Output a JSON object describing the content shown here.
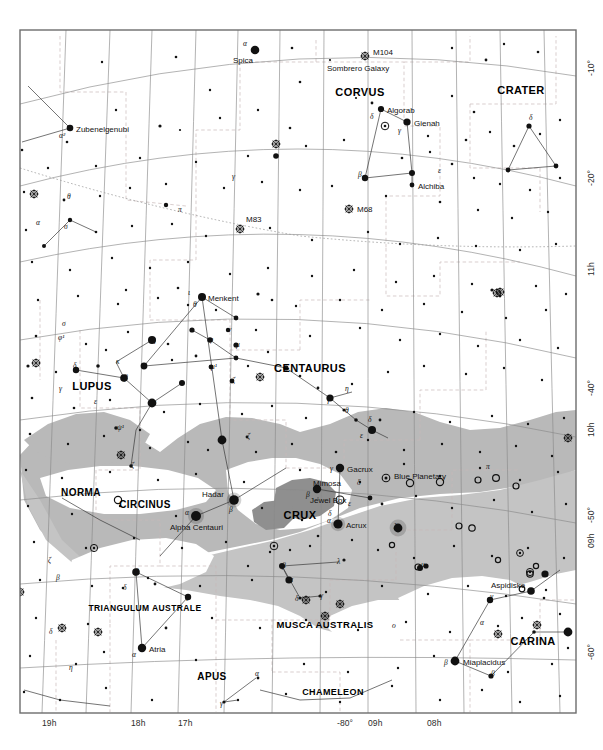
{
  "chart_data": {
    "type": "scatter",
    "projection": "conic equidistant",
    "grid": true,
    "legend_position": "none",
    "xlabel": "Right Ascension (hours)",
    "ylabel": "Declination (degrees)",
    "xlim": [
      19,
      7.5
    ],
    "ylim": [
      -65,
      -5
    ],
    "background_color": "#ffffff",
    "milky_way_color": "#b8b8b8",
    "milky_way_dark_color": "#9a9a9a",
    "grid_color": "#7c7c7c",
    "boundary_color": "#b0a9a9",
    "frame_color": "#6d6d6d",
    "star_color": "#111111",
    "axis_ticks_ra_bottom": [
      {
        "label": "19h",
        "x": 42
      },
      {
        "label": "18h",
        "x": 131
      },
      {
        "label": "17h",
        "x": 178
      },
      {
        "label": "-80°",
        "x": 337
      },
      {
        "label": "09h",
        "x": 368
      },
      {
        "label": "08h",
        "x": 427
      }
    ],
    "axis_ticks_right": [
      {
        "label": "-10°",
        "y": 76
      },
      {
        "label": "-20°",
        "y": 186
      },
      {
        "label": "11h",
        "y": 276
      },
      {
        "label": "-40°",
        "y": 396
      },
      {
        "label": "10h",
        "y": 437
      },
      {
        "label": "-50°",
        "y": 523
      },
      {
        "label": "09h",
        "y": 548
      },
      {
        "label": "-60°",
        "y": 660
      }
    ],
    "constellations": [
      {
        "name": "CORVUS",
        "x": 360,
        "y": 92,
        "size": 11
      },
      {
        "name": "CRATER",
        "x": 521,
        "y": 90,
        "size": 11
      },
      {
        "name": "CENTAURUS",
        "x": 310,
        "y": 368,
        "size": 11
      },
      {
        "name": "LUPUS",
        "x": 92,
        "y": 386,
        "size": 11
      },
      {
        "name": "NORMA",
        "x": 81,
        "y": 492,
        "size": 10
      },
      {
        "name": "CIRCINUS",
        "x": 145,
        "y": 504,
        "size": 10
      },
      {
        "name": "CRUX",
        "x": 300,
        "y": 515,
        "size": 11
      },
      {
        "name": "MUSCA AUSTRALIS",
        "x": 325,
        "y": 624,
        "size": 9.5
      },
      {
        "name": "TRIANGULUM AUSTRALE",
        "x": 145,
        "y": 608,
        "size": 8.5
      },
      {
        "name": "APUS",
        "x": 212,
        "y": 676,
        "size": 10
      },
      {
        "name": "CHAMELEON",
        "x": 333,
        "y": 692,
        "size": 9
      },
      {
        "name": "CARINA",
        "x": 533,
        "y": 641,
        "size": 11
      }
    ],
    "named_stars": [
      {
        "name": "Spica",
        "x": 255,
        "y": 50,
        "mag": 1.0,
        "label_dx": -22,
        "label_dy": 12,
        "greek": "α",
        "gdx": -12,
        "gdy": -5
      },
      {
        "name": "Zubenelgenubi",
        "x": 70,
        "y": 128,
        "mag": 2.7,
        "label_dx": 6,
        "label_dy": 3,
        "greek": "α²",
        "gdx": -11,
        "gdy": 9
      },
      {
        "name": "Algorab",
        "x": 381,
        "y": 109,
        "mag": 2.9,
        "label_dx": 6,
        "label_dy": 3,
        "greek": "δ",
        "gdx": -11,
        "gdy": 9
      },
      {
        "name": "Gienah",
        "x": 407,
        "y": 122,
        "mag": 2.6,
        "label_dx": 7,
        "label_dy": 3,
        "greek": "γ",
        "gdx": -9,
        "gdy": 10
      },
      {
        "name": "Alchiba",
        "x": 412,
        "y": 185,
        "mag": 4.0,
        "label_dx": 6,
        "label_dy": 3,
        "greek": "",
        "gdx": 0,
        "gdy": 0
      },
      {
        "name": "Menkent",
        "x": 202,
        "y": 297,
        "mag": 2.1,
        "label_dx": 6,
        "label_dy": 3,
        "greek": "θ",
        "gdx": -9,
        "gdy": 9
      },
      {
        "name": "Gacrux",
        "x": 340,
        "y": 468,
        "mag": 1.6,
        "label_dx": 7,
        "label_dy": 3,
        "greek": "γ",
        "gdx": -10,
        "gdy": 2
      },
      {
        "name": "Mimosa",
        "x": 317,
        "y": 489,
        "mag": 1.3,
        "label_dx": -4,
        "label_dy": -4,
        "greek": "β",
        "gdx": -11,
        "gdy": 7
      },
      {
        "name": "Acrux",
        "x": 338,
        "y": 524,
        "mag": 0.8,
        "label_dx": 8,
        "label_dy": 3,
        "greek": "α",
        "gdx": -11,
        "gdy": -2
      },
      {
        "name": "Hadar",
        "x": 234,
        "y": 500,
        "mag": 0.6,
        "label_dx": -32,
        "label_dy": -4,
        "greek": "β",
        "gdx": -5,
        "gdy": 11
      },
      {
        "name": "Alpha Centauri",
        "x": 196,
        "y": 516,
        "mag": 0.0,
        "label_dx": -26,
        "label_dy": 13,
        "greek": "α",
        "gdx": -11,
        "gdy": -2
      },
      {
        "name": "Atria",
        "x": 142,
        "y": 648,
        "mag": 1.9,
        "label_dx": 7,
        "label_dy": 3,
        "greek": "α",
        "gdx": -10,
        "gdy": 8
      },
      {
        "name": "Miaplacidus",
        "x": 455,
        "y": 661,
        "mag": 1.7,
        "label_dx": 8,
        "label_dy": 3,
        "greek": "β",
        "gdx": -11,
        "gdy": 3
      },
      {
        "name": "Aspidiske",
        "x": 531,
        "y": 591,
        "mag": 2.2,
        "label_dx": -40,
        "label_dy": -4,
        "greek": "",
        "gdx": 0,
        "gdy": 0
      }
    ],
    "deep_sky_objects": [
      {
        "name": "M104",
        "x": 365,
        "y": 56,
        "kind": "galaxy",
        "label_dx": 8,
        "label_dy": -2
      },
      {
        "name": "Sombrero Galaxy",
        "x": 365,
        "y": 56,
        "kind": "caption",
        "label_dx": -38,
        "label_dy": 14
      },
      {
        "name": "M68",
        "x": 349,
        "y": 209,
        "kind": "globular",
        "label_dx": 8,
        "label_dy": 2
      },
      {
        "name": "M83",
        "x": 240,
        "y": 229,
        "kind": "galaxy",
        "label_dx": 6,
        "label_dy": -8
      },
      {
        "name": "Blue Planetary",
        "x": 386,
        "y": 478,
        "kind": "planetary",
        "label_dx": 8,
        "label_dy": 0
      },
      {
        "name": "Jewel Box",
        "x": 340,
        "y": 500,
        "kind": "open",
        "label_dx": -30,
        "label_dy": 2
      }
    ],
    "greek_labels": [
      {
        "g": "δ",
        "x": 529,
        "y": 118
      },
      {
        "g": "γ",
        "x": 232,
        "y": 177
      },
      {
        "g": "π",
        "x": 178,
        "y": 210
      },
      {
        "g": "σ",
        "x": 64,
        "y": 227
      },
      {
        "g": "θ",
        "x": 67,
        "y": 197
      },
      {
        "g": "ε",
        "x": 438,
        "y": 171
      },
      {
        "g": "β",
        "x": 358,
        "y": 175
      },
      {
        "g": "σ",
        "x": 62,
        "y": 324
      },
      {
        "g": "φ¹",
        "x": 58,
        "y": 338
      },
      {
        "g": "δ",
        "x": 73,
        "y": 366
      },
      {
        "g": "γ",
        "x": 59,
        "y": 389
      },
      {
        "g": "κ",
        "x": 116,
        "y": 362
      },
      {
        "g": "β",
        "x": 124,
        "y": 378
      },
      {
        "g": "ε",
        "x": 94,
        "y": 402
      },
      {
        "g": "α",
        "x": 152,
        "y": 403
      },
      {
        "g": "ψ¹",
        "x": 117,
        "y": 428
      },
      {
        "g": "ζ",
        "x": 131,
        "y": 466
      },
      {
        "g": "η",
        "x": 152,
        "y": 340
      },
      {
        "g": "ι",
        "x": 182,
        "y": 383
      },
      {
        "g": "φ",
        "x": 209,
        "y": 340
      },
      {
        "g": "μ",
        "x": 236,
        "y": 345
      },
      {
        "g": "ν",
        "x": 228,
        "y": 330
      },
      {
        "g": "μ¹",
        "x": 211,
        "y": 367
      },
      {
        "g": "ζ",
        "x": 232,
        "y": 381
      },
      {
        "g": "γ",
        "x": 327,
        "y": 400
      },
      {
        "g": "η",
        "x": 345,
        "y": 389
      },
      {
        "g": "θ",
        "x": 345,
        "y": 411
      },
      {
        "g": "δ",
        "x": 368,
        "y": 420
      },
      {
        "g": "ε",
        "x": 360,
        "y": 436
      },
      {
        "g": "ζ",
        "x": 247,
        "y": 437
      },
      {
        "g": "π",
        "x": 486,
        "y": 467
      },
      {
        "g": "δ",
        "x": 357,
        "y": 483
      },
      {
        "g": "ε",
        "x": 348,
        "y": 504
      },
      {
        "g": "δ",
        "x": 328,
        "y": 514
      },
      {
        "g": "λ",
        "x": 394,
        "y": 527
      },
      {
        "g": "β",
        "x": 282,
        "y": 566
      },
      {
        "g": "α",
        "x": 289,
        "y": 580
      },
      {
        "g": "λ",
        "x": 337,
        "y": 562
      },
      {
        "g": "θ",
        "x": 418,
        "y": 568
      },
      {
        "g": "μ",
        "x": 421,
        "y": 565
      },
      {
        "g": "ν",
        "x": 490,
        "y": 597
      },
      {
        "g": "δ",
        "x": 295,
        "y": 599
      },
      {
        "g": "γ",
        "x": 320,
        "y": 596
      },
      {
        "g": "ο",
        "x": 392,
        "y": 626
      },
      {
        "g": "α",
        "x": 480,
        "y": 623
      },
      {
        "g": "β",
        "x": 491,
        "y": 674
      },
      {
        "g": "ε",
        "x": 568,
        "y": 632
      },
      {
        "g": "κ",
        "x": 544,
        "y": 573
      },
      {
        "g": "ζ",
        "x": 48,
        "y": 561
      },
      {
        "g": "β",
        "x": 56,
        "y": 578
      },
      {
        "g": "β",
        "x": 135,
        "y": 572
      },
      {
        "g": "δ",
        "x": 123,
        "y": 588
      },
      {
        "g": "γ",
        "x": 186,
        "y": 597
      },
      {
        "g": "δ",
        "x": 49,
        "y": 632
      },
      {
        "g": "η",
        "x": 69,
        "y": 668
      },
      {
        "g": "α",
        "x": 255,
        "y": 674
      },
      {
        "g": "γ",
        "x": 220,
        "y": 704
      },
      {
        "g": "α",
        "x": 36,
        "y": 223
      },
      {
        "g": "ι",
        "x": 188,
        "y": 293
      }
    ]
  },
  "frame": {
    "left": 20,
    "top": 30,
    "width": 556,
    "height": 683
  }
}
